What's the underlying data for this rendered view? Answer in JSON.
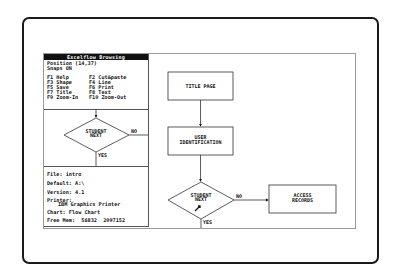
{
  "panel": {
    "title": "Excelflow Browsing",
    "position": "Position (14,37)",
    "snaps": "Snaps ON",
    "keys": [
      {
        "left": "F1 Help",
        "right": "F2 Cut&paste"
      },
      {
        "left": "F3 Shape",
        "right": "F4 Line"
      },
      {
        "left": "F5 Save",
        "right": "F6 Print"
      },
      {
        "left": "F7 Title",
        "right": "F8 Text"
      },
      {
        "left": "F9 Zoom-In",
        "right": "F10 Zoom-Out"
      }
    ],
    "preview": {
      "decision_label_1": "STUDENT",
      "decision_label_2": "NEXT",
      "no_label": "NO",
      "yes_label": "YES"
    },
    "info": {
      "file": "File: intro",
      "default": "Default: A:\\",
      "version": "Version: 4.1",
      "printer_label": "Printer:",
      "printer_value": "IBM Graphics Printer",
      "chart": "Chart: Flow Chart",
      "free_mem": "Free Mem:  56832  2097152"
    }
  },
  "flowchart": {
    "nodes": {
      "title_page": "TITLE PAGE",
      "user_id_1": "USER",
      "user_id_2": "IDENTIFICATION",
      "decision_1": "STUDENT",
      "decision_2": "NEXT",
      "access_1": "ACCESS",
      "access_2": "RECORDS"
    },
    "no_label": "NO",
    "yes_label": "YES"
  }
}
